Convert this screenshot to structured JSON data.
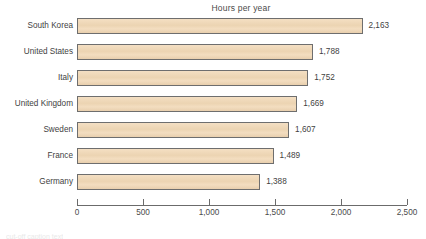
{
  "chart_data": {
    "type": "bar",
    "orientation": "horizontal",
    "title": "Hours per year",
    "xlabel": "",
    "ylabel": "",
    "categories": [
      "South Korea",
      "United States",
      "Italy",
      "United Kingdom",
      "Sweden",
      "France",
      "Germany"
    ],
    "values": [
      2163,
      1788,
      1752,
      1669,
      1607,
      1489,
      1388
    ],
    "value_labels": [
      "2,163",
      "1,788",
      "1,752",
      "1,669",
      "1,607",
      "1,489",
      "1,388"
    ],
    "xlim": [
      0,
      2500
    ],
    "xticks": [
      0,
      500,
      1000,
      1500,
      2000,
      2500
    ],
    "xtick_labels": [
      "0",
      "500",
      "1,000",
      "1,500",
      "2,000",
      "2,500"
    ],
    "grid": false,
    "legend": null,
    "bar_fill_color": "#eed6b4",
    "bar_border_color": "#6e6e6e",
    "text_color": "#3f3f3f",
    "background_color": "#ffffff"
  },
  "caption_sliver": "cut-off caption text"
}
